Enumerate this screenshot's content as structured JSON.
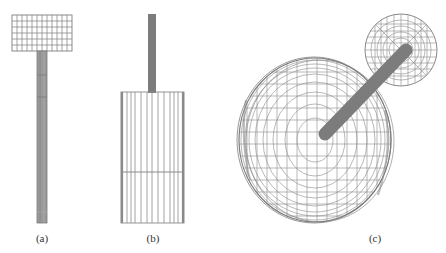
{
  "figure": {
    "panels": [
      {
        "id": "a",
        "label": "(a)",
        "view": "side view: disc atop long rod"
      },
      {
        "id": "b",
        "label": "(b)",
        "view": "side view: rod atop tall cylinder"
      },
      {
        "id": "c",
        "label": "(c)",
        "view": "oblique view: large disc with rod and small disc"
      }
    ]
  },
  "colors": {
    "background": "#ffffff",
    "mesh": "#8a8a8a",
    "mesh_dark": "#6e6e6e",
    "rod": "#7c7c7c",
    "label": "#333333"
  }
}
